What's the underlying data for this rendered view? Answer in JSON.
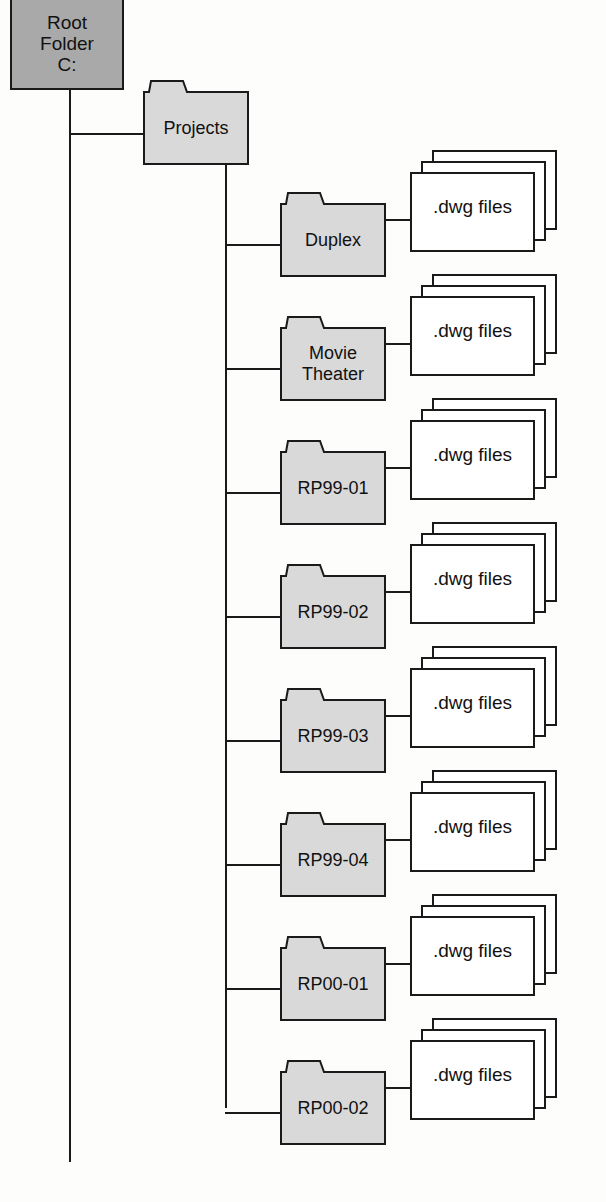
{
  "diagram": {
    "colors": {
      "root_fill": "#a9a9a9",
      "folder_fill": "#d9d9d9",
      "line": "#1a1a1a",
      "file_fill": "#ffffff"
    },
    "root": {
      "label": "Root\nFolder\nC:"
    },
    "projects": {
      "label": "Projects"
    },
    "subfolders": [
      {
        "label": "Duplex",
        "files_label": ".dwg files"
      },
      {
        "label": "Movie\nTheater",
        "files_label": ".dwg files"
      },
      {
        "label": "RP99-01",
        "files_label": ".dwg files"
      },
      {
        "label": "RP99-02",
        "files_label": ".dwg files"
      },
      {
        "label": "RP99-03",
        "files_label": ".dwg files"
      },
      {
        "label": "RP99-04",
        "files_label": ".dwg files"
      },
      {
        "label": "RP00-01",
        "files_label": ".dwg files"
      },
      {
        "label": "RP00-02",
        "files_label": ".dwg files"
      }
    ]
  }
}
